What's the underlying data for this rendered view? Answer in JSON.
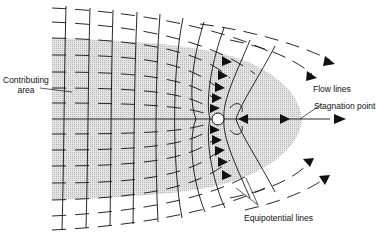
{
  "diagram": {
    "type": "groundwater flow net toward a pumping well",
    "labels": {
      "contributing_area": [
        "Contributing",
        "area"
      ],
      "flow_lines": "Flow lines",
      "stagnation_point": "Stagnation point",
      "equipotential_lines": "Equipotential lines"
    },
    "colors": {
      "line": "#111111",
      "shaded_area": "#d6d6d6",
      "background": "#ffffff",
      "well": "#ffffff"
    },
    "well": {
      "x": 218,
      "y": 119,
      "r": 6
    },
    "stagnation": {
      "x": 268,
      "y": 119
    }
  }
}
